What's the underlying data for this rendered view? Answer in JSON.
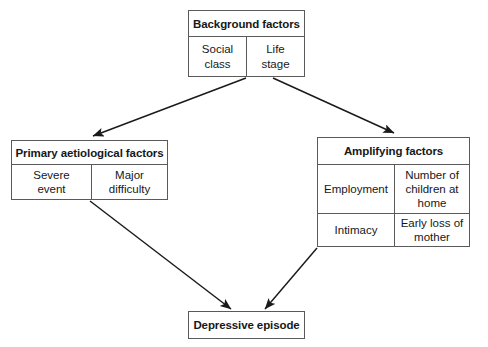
{
  "diagram": {
    "background_color": "#ffffff",
    "line_color": "#5a5a5a",
    "arrow_color": "#1a1a1a",
    "text_color": "#16181a"
  },
  "boxes": {
    "background_factors": {
      "header": "Background factors",
      "cells": [
        {
          "label": "Social\nclass"
        },
        {
          "label": "Life\nstage"
        }
      ]
    },
    "primary_aetiological_factors": {
      "header": "Primary aetiological factors",
      "cells": [
        {
          "label": "Severe\nevent"
        },
        {
          "label": "Major\ndifficulty"
        }
      ]
    },
    "amplifying_factors": {
      "header": "Amplifying factors",
      "rows": [
        [
          {
            "label": "Employment"
          },
          {
            "label": "Number of\nchildren at\nhome"
          }
        ],
        [
          {
            "label": "Intimacy"
          },
          {
            "label": "Early loss of\nmother"
          }
        ]
      ]
    },
    "outcome": {
      "header": "Depressive episode"
    }
  },
  "arrows": [
    {
      "name": "background-to-primary",
      "from": "background_factors",
      "to": "primary_aetiological_factors",
      "x1": 246,
      "y1": 78,
      "x2": 93,
      "y2": 136
    },
    {
      "name": "background-to-amplifying",
      "from": "background_factors",
      "to": "amplifying_factors",
      "x1": 273,
      "y1": 78,
      "x2": 394,
      "y2": 133
    },
    {
      "name": "primary-to-outcome",
      "from": "primary_aetiological_factors",
      "to": "outcome",
      "x1": 90,
      "y1": 201,
      "x2": 231,
      "y2": 309
    },
    {
      "name": "amplifying-to-outcome",
      "from": "amplifying_factors",
      "to": "outcome",
      "x1": 317,
      "y1": 248,
      "x2": 265,
      "y2": 309
    }
  ]
}
